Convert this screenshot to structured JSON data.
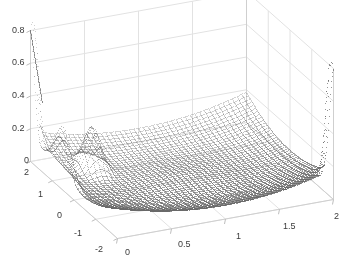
{
  "figure": {
    "type": "3d-surface-plot",
    "width": 355,
    "height": 261,
    "background_color": "#ffffff",
    "grid_color": "#e2e2e2",
    "axis_line_color": "#cfcfcf",
    "marker_color": "#7d7d7d",
    "tick_text_color": "#3a3a3a",
    "marker_style": "dot-mesh"
  },
  "chart_data": {
    "type": "scatter",
    "render": "3d-dotted-mesh-surface",
    "title": "",
    "xlabel": "",
    "ylabel": "",
    "zlabel": "",
    "grid": true,
    "legend": "none",
    "xlim": [
      0,
      2
    ],
    "ylim": [
      -2,
      2
    ],
    "zlim": [
      0,
      0.8
    ],
    "x_ticks": [
      0,
      0.5,
      1,
      1.5,
      2
    ],
    "x_tick_labels": [
      "0",
      "0.5",
      "1",
      "1.5",
      "2"
    ],
    "y_ticks": [
      2,
      1,
      0,
      -1,
      -2
    ],
    "y_tick_labels": [
      "2",
      "1",
      "0",
      "-1",
      "-2"
    ],
    "z_ticks": [
      0,
      0.2,
      0.4,
      0.6,
      0.8
    ],
    "z_tick_labels": [
      "0",
      "0.2",
      "0.4",
      "0.6",
      "0.8"
    ],
    "surface_note": "Dotted mesh surface over x in [0,2], y in [-2,2]; bowl-shaped valley rising toward corners with sharp narrow spikes near the x=0 and x=2 edges reaching z ~ 0.8",
    "grid_nx": 46,
    "grid_ny": 46,
    "view_azimuth_deg": -37.5,
    "view_elevation_deg": 30
  },
  "z_axis": {
    "name": "z-axis",
    "ticks": [
      {
        "label": "0.8",
        "value": 0.8,
        "left": 12,
        "top": 26
      },
      {
        "label": "0.6",
        "value": 0.6,
        "left": 12,
        "top": 58
      },
      {
        "label": "0.4",
        "value": 0.4,
        "left": 12,
        "top": 91
      },
      {
        "label": "0.2",
        "value": 0.2,
        "left": 12,
        "top": 124
      },
      {
        "label": "0",
        "value": 0.0,
        "left": 24,
        "top": 156
      }
    ]
  },
  "y_axis": {
    "name": "y-axis",
    "ticks": [
      {
        "label": "2",
        "value": 2,
        "left": 24,
        "top": 168
      },
      {
        "label": "1",
        "value": 1,
        "left": 38,
        "top": 190
      },
      {
        "label": "0",
        "value": 0,
        "left": 57,
        "top": 211
      },
      {
        "label": "-1",
        "value": -1,
        "left": 74,
        "top": 229
      },
      {
        "label": "-2",
        "value": -2,
        "left": 95,
        "top": 245
      }
    ]
  },
  "x_axis": {
    "name": "x-axis",
    "ticks": [
      {
        "label": "0",
        "value": 0,
        "left": 125,
        "top": 248
      },
      {
        "label": "0.5",
        "value": 0.5,
        "left": 178,
        "top": 240
      },
      {
        "label": "1",
        "value": 1,
        "left": 236,
        "top": 232
      },
      {
        "label": "1.5",
        "value": 1.5,
        "left": 283,
        "top": 222
      },
      {
        "label": "2",
        "value": 2,
        "left": 334,
        "top": 212
      }
    ]
  }
}
